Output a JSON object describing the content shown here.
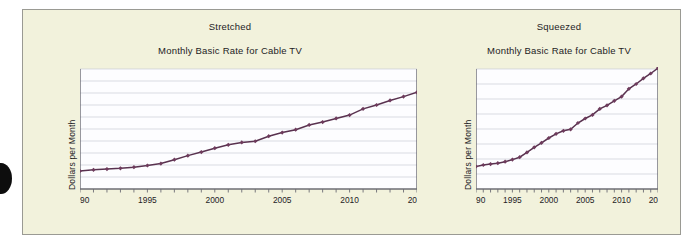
{
  "figure": {
    "bullet_icon": "page-bullet-icon",
    "panel_background": "#f2f2dc",
    "line_color": "#59324f",
    "marker_color": "#6e3b5c",
    "grid_color": "#c9ccd6",
    "axis_color": "#6c6c74",
    "plot_background": "#fdfdff"
  },
  "panels": [
    {
      "kind": "Stretched",
      "title": "Monthly Basic Rate for Cable TV",
      "ylabel": "Dollars per Month"
    },
    {
      "kind": "Squeezed",
      "title": "Monthly Basic Rate for Cable TV",
      "ylabel": "Dollars per Month"
    }
  ],
  "chart_data": [
    {
      "type": "line",
      "title": "Monthly Basic Rate for Cable TV",
      "subtitle": "Stretched",
      "xlabel": "",
      "ylabel": "Dollars per Month",
      "xlim": [
        1990,
        2015
      ],
      "ylim": [
        0,
        50
      ],
      "yticks": [
        0,
        5,
        10,
        15,
        20,
        25,
        30,
        35,
        40,
        45,
        50
      ],
      "xticks": [
        1990,
        1991,
        1992,
        1993,
        1994,
        1995,
        1996,
        1997,
        1998,
        1999,
        2000,
        2001,
        2002,
        2003,
        2004,
        2005,
        2006,
        2007,
        2008,
        2009,
        2010,
        2011,
        2012,
        2013,
        2014,
        2015
      ],
      "xtick_labels": [
        "1990",
        "",
        "",
        "",
        "",
        "1995",
        "",
        "",
        "",
        "",
        "2000",
        "",
        "",
        "",
        "",
        "2005",
        "",
        "",
        "",
        "",
        "2010",
        "",
        "",
        "",
        "",
        "2015"
      ],
      "grid": true,
      "legend": false,
      "x": [
        1990,
        1991,
        1992,
        1993,
        1994,
        1995,
        1996,
        1997,
        1998,
        1999,
        2000,
        2001,
        2002,
        2003,
        2004,
        2005,
        2006,
        2007,
        2008,
        2009,
        2010,
        2011,
        2012,
        2013,
        2014,
        2015
      ],
      "values": [
        7.5,
        8.0,
        8.3,
        8.6,
        9.1,
        9.8,
        10.6,
        12.2,
        13.9,
        15.4,
        17.0,
        18.4,
        19.4,
        19.9,
        22.0,
        23.5,
        24.7,
        26.7,
        27.9,
        29.4,
        30.8,
        33.4,
        35.0,
        36.9,
        38.5,
        40.3
      ]
    },
    {
      "type": "line",
      "title": "Monthly Basic Rate for Cable TV",
      "subtitle": "Squeezed",
      "xlabel": "",
      "ylabel": "Dollars per Month",
      "xlim": [
        1990,
        2015
      ],
      "ylim": [
        0,
        40
      ],
      "yticks": [
        0,
        5,
        10,
        15,
        20,
        25,
        30,
        35,
        40
      ],
      "xticks": [
        1990,
        1991,
        1992,
        1993,
        1994,
        1995,
        1996,
        1997,
        1998,
        1999,
        2000,
        2001,
        2002,
        2003,
        2004,
        2005,
        2006,
        2007,
        2008,
        2009,
        2010,
        2011,
        2012,
        2013,
        2014,
        2015
      ],
      "xtick_labels": [
        "1990",
        "",
        "",
        "",
        "",
        "1995",
        "",
        "",
        "",
        "",
        "2000",
        "",
        "",
        "",
        "",
        "2005",
        "",
        "",
        "",
        "",
        "2010",
        "",
        "",
        "",
        "",
        "2015"
      ],
      "grid": true,
      "legend": false,
      "x": [
        1990,
        1991,
        1992,
        1993,
        1994,
        1995,
        1996,
        1997,
        1998,
        1999,
        2000,
        2001,
        2002,
        2003,
        2004,
        2005,
        2006,
        2007,
        2008,
        2009,
        2010,
        2011,
        2012,
        2013,
        2014,
        2015
      ],
      "values": [
        7.5,
        8.0,
        8.3,
        8.6,
        9.1,
        9.8,
        10.6,
        12.2,
        13.9,
        15.4,
        17.0,
        18.4,
        19.4,
        19.9,
        22.0,
        23.5,
        24.7,
        26.7,
        27.9,
        29.4,
        30.8,
        33.4,
        35.0,
        36.9,
        38.5,
        40.3
      ]
    }
  ]
}
